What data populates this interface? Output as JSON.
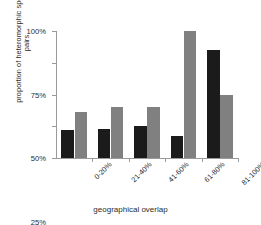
{
  "chart_data": {
    "type": "bar",
    "title": "",
    "xlabel": "geographical overlap",
    "ylabel_lines": [
      "proportion of heteromorphic species",
      "pairs"
    ],
    "ylabel": "proportion of heteromorphic species pairs",
    "categories": [
      "0-20%",
      "21-40%",
      "41-60%",
      "61-80%",
      "81-100%"
    ],
    "series": [
      {
        "name": "dark",
        "color": "#1b1b1b",
        "values": [
          22,
          23,
          25,
          17,
          85
        ]
      },
      {
        "name": "gray",
        "color": "#808080",
        "values": [
          36,
          40,
          40,
          100,
          50
        ]
      }
    ],
    "ylim": [
      0,
      100
    ],
    "yticks": [
      0,
      25,
      50,
      75,
      100
    ],
    "ytick_labels": [
      "0%",
      "25%",
      "50%",
      "75%",
      "100%"
    ],
    "grid": false,
    "legend": "none",
    "axis_color": "#9a9a9a"
  }
}
